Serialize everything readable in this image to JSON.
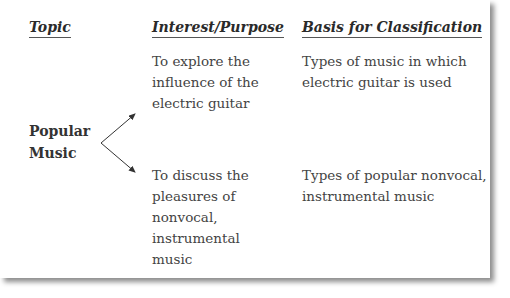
{
  "headers": {
    "topic": "Topic",
    "interest": "Interest/Purpose",
    "basis": "Basis for Classification"
  },
  "topic": {
    "line1": "Popular",
    "line2": "Music"
  },
  "rows": [
    {
      "purpose": [
        "To explore the",
        "influence of the",
        "electric guitar"
      ],
      "basis": [
        "Types of music in which",
        "electric guitar is used"
      ]
    },
    {
      "purpose": [
        "To discuss the",
        "pleasures of",
        "nonvocal,",
        "instrumental",
        "music"
      ],
      "basis": [
        "Types of popular nonvocal,",
        "instrumental music"
      ]
    }
  ]
}
